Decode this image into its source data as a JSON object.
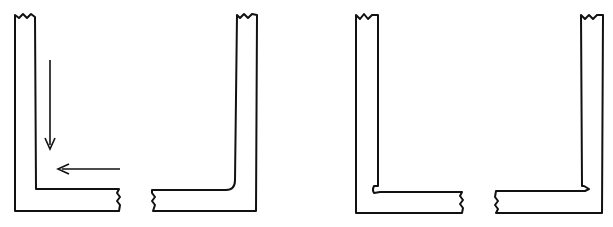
{
  "figure": {
    "panels": [
      {
        "id": "sharp-inner-corner-with-arrows",
        "arrows": [
          "down",
          "left"
        ]
      },
      {
        "id": "rounded-inner-corner",
        "arrows": []
      },
      {
        "id": "notched-inner-corner",
        "arrows": []
      },
      {
        "id": "lapped-inner-corner",
        "arrows": []
      }
    ],
    "colors": {
      "line": "#111111",
      "background": "#ffffff"
    }
  }
}
